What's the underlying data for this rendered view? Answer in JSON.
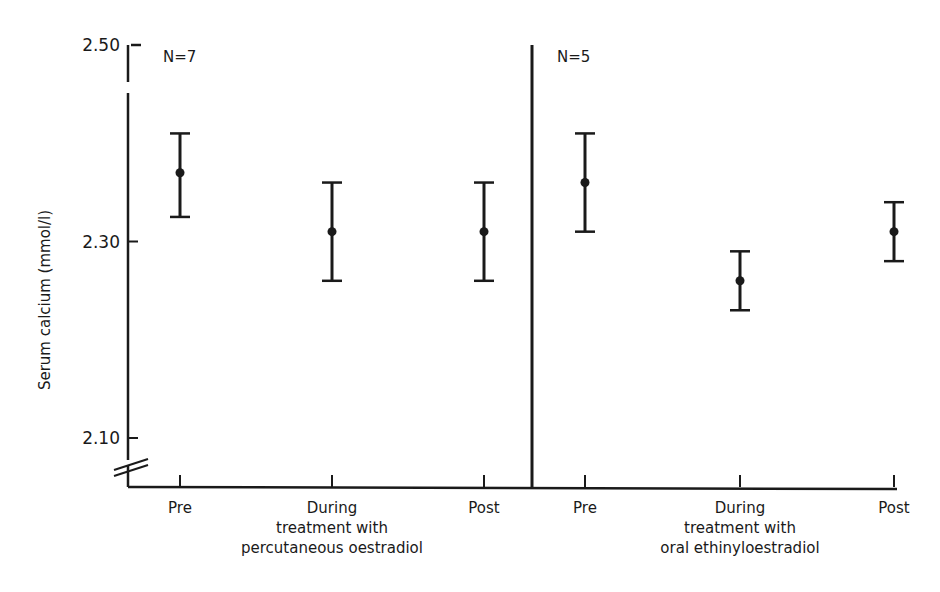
{
  "chart_data": {
    "type": "scatter",
    "subtype": "mean_with_error_bars",
    "title": "",
    "ylabel": "Serum calcium (mmol/l)",
    "xlabel": "",
    "ylim": [
      2.05,
      2.5
    ],
    "y_axis_break": true,
    "yticks": [
      2.1,
      2.3,
      2.5
    ],
    "ytick_labels": [
      "2.10",
      "2.30",
      "2.50"
    ],
    "grid": false,
    "legend": null,
    "panels": [
      {
        "n_label": "N=7",
        "group_label_lines": [
          "During",
          "treatment with",
          "percutaneous oestradiol"
        ],
        "categories": [
          "Pre",
          "During",
          "Post"
        ],
        "mean": [
          2.37,
          2.31,
          2.31
        ],
        "upper": [
          2.41,
          2.36,
          2.36
        ],
        "lower": [
          2.325,
          2.26,
          2.26
        ]
      },
      {
        "n_label": "N=5",
        "group_label_lines": [
          "During",
          "treatment with",
          "oral ethinyloestradiol"
        ],
        "categories": [
          "Pre",
          "During",
          "Post"
        ],
        "mean": [
          2.36,
          2.26,
          2.31
        ],
        "upper": [
          2.41,
          2.29,
          2.34
        ],
        "lower": [
          2.31,
          2.23,
          2.28
        ]
      }
    ]
  }
}
